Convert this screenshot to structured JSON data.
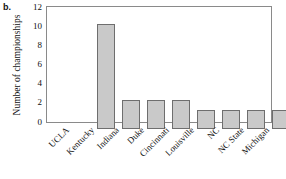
{
  "panel": {
    "label": "b."
  },
  "chart_data": {
    "type": "bar",
    "title": "",
    "xlabel": "",
    "ylabel": "Number of championships",
    "categories": [
      "UCLA",
      "Kentucky",
      "Indiana",
      "Duke",
      "Cincinnati",
      "Louisville",
      "NC",
      "NC State",
      "Michigan"
    ],
    "values": [
      11,
      3,
      3,
      3,
      2,
      2,
      2,
      2,
      2
    ],
    "ylim": [
      0,
      12
    ],
    "ytick_labels": [
      "0",
      "2",
      "4",
      "6",
      "8",
      "10",
      "12"
    ],
    "ytick_values": [
      0,
      2,
      4,
      6,
      8,
      10,
      12
    ],
    "grid": false,
    "legend": null,
    "bar_fill_color": "#c9c9c9",
    "bar_edge_color": "#6e6e6e",
    "axis_color": "#8a8a8a",
    "xtick_label_rotation_deg": 45
  }
}
